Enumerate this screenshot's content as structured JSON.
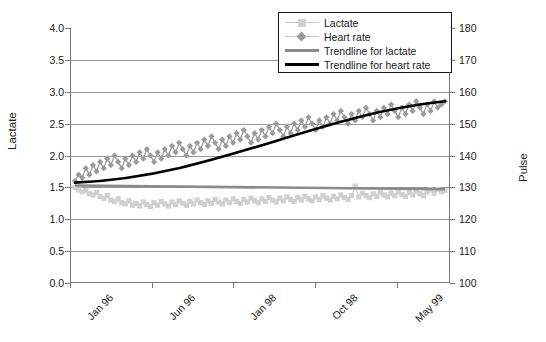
{
  "chart_data": {
    "type": "line",
    "title": "",
    "xlabel": "",
    "ylabel": "Lactate",
    "y2label": "Pulse",
    "ylim": [
      0.0,
      4.0
    ],
    "y2lim": [
      100,
      180
    ],
    "grid": true,
    "legend_position": "top-right",
    "y_ticks": [
      "0.0",
      "0.5",
      "1.0",
      "1.5",
      "2.0",
      "2.5",
      "3.0",
      "3.5",
      "4.0"
    ],
    "y2_ticks": [
      "100",
      "110",
      "120",
      "130",
      "140",
      "150",
      "160",
      "170",
      "180"
    ],
    "x_tick_labels": [
      "Jan 96",
      "Jun 96",
      "Jan 98",
      "Oct 98",
      "May 99"
    ],
    "x_tick_positions": [
      0,
      0.215,
      0.43,
      0.645,
      0.86
    ],
    "colors": {
      "lactate_marker": "#d0d0d0",
      "heart_rate_marker": "#9a9a9a",
      "trendline_lactate": "#8a8a8a",
      "trendline_heart_rate": "#000000",
      "axis": "#7a7a7a",
      "grid": "#9a9a9a",
      "text": "#1a1a1a"
    },
    "series": [
      {
        "name": "Lactate",
        "axis": "left",
        "marker": "square",
        "color": "#d0d0d0",
        "values": [
          1.5,
          1.46,
          1.43,
          1.45,
          1.4,
          1.38,
          1.42,
          1.36,
          1.33,
          1.37,
          1.3,
          1.28,
          1.32,
          1.26,
          1.24,
          1.29,
          1.22,
          1.25,
          1.21,
          1.27,
          1.23,
          1.2,
          1.26,
          1.22,
          1.28,
          1.24,
          1.21,
          1.27,
          1.23,
          1.29,
          1.25,
          1.22,
          1.28,
          1.24,
          1.3,
          1.26,
          1.23,
          1.29,
          1.25,
          1.31,
          1.27,
          1.24,
          1.3,
          1.26,
          1.32,
          1.28,
          1.25,
          1.31,
          1.27,
          1.33,
          1.29,
          1.26,
          1.32,
          1.28,
          1.34,
          1.3,
          1.27,
          1.33,
          1.29,
          1.35,
          1.31,
          1.28,
          1.34,
          1.3,
          1.36,
          1.32,
          1.29,
          1.35,
          1.31,
          1.37,
          1.33,
          1.3,
          1.36,
          1.32,
          1.38,
          1.34,
          1.31,
          1.37,
          1.52,
          1.35,
          1.41,
          1.37,
          1.34,
          1.4,
          1.36,
          1.42,
          1.38,
          1.35,
          1.41,
          1.37,
          1.43,
          1.39,
          1.36,
          1.42,
          1.38,
          1.44,
          1.4,
          1.37,
          1.43,
          1.46,
          1.41,
          1.47,
          1.43,
          1.45
        ]
      },
      {
        "name": "Heart rate",
        "axis": "right",
        "marker": "diamond",
        "color": "#9a9a9a",
        "values": [
          132,
          134,
          133,
          136,
          134,
          137,
          135,
          138,
          136,
          139,
          137,
          140,
          138,
          136,
          139,
          137,
          140,
          138,
          141,
          139,
          142,
          140,
          138,
          141,
          139,
          142,
          140,
          143,
          141,
          144,
          142,
          140,
          143,
          141,
          144,
          142,
          145,
          143,
          146,
          144,
          142,
          145,
          143,
          146,
          144,
          147,
          145,
          148,
          146,
          144,
          147,
          145,
          148,
          146,
          149,
          147,
          150,
          148,
          146,
          149,
          147,
          150,
          148,
          151,
          149,
          152,
          150,
          148,
          151,
          149,
          152,
          150,
          153,
          151,
          154,
          152,
          150,
          153,
          151,
          154,
          152,
          155,
          153,
          151,
          154,
          152,
          155,
          153,
          156,
          154,
          152,
          155,
          153,
          156,
          154,
          157,
          155,
          153,
          156,
          154,
          157,
          155,
          156,
          157
        ]
      }
    ],
    "trendlines": [
      {
        "name": "Trendline for lactate",
        "axis": "left",
        "color": "#8a8a8a",
        "start_value": 1.53,
        "end_value": 1.47,
        "shape": "flat"
      },
      {
        "name": "Trendline for heart rate",
        "axis": "right",
        "color": "#000000",
        "start_value": 131.5,
        "end_value": 157.0,
        "shape": "s-curve"
      }
    ]
  },
  "legend": {
    "items": [
      {
        "label": "Lactate",
        "key": "square-marker-key"
      },
      {
        "label": "Heart rate",
        "key": "diamond-marker-key"
      },
      {
        "label": "Trendline for lactate",
        "key": "gray-line-key"
      },
      {
        "label": "Trendline for heart rate",
        "key": "black-line-key"
      }
    ]
  },
  "axes": {
    "left_title": "Lactate",
    "right_title": "Pulse"
  }
}
